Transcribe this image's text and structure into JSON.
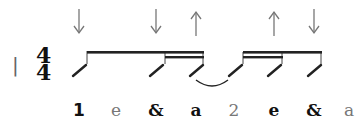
{
  "notation": {
    "barline": "|",
    "time_signature": {
      "top": "4",
      "bottom": "4"
    },
    "strum_arrows": [
      {
        "direction": "down",
        "x": 79
      },
      {
        "direction": "down",
        "x": 156
      },
      {
        "direction": "up",
        "x": 196
      },
      {
        "direction": "up",
        "x": 274
      },
      {
        "direction": "down",
        "x": 314
      }
    ],
    "counting": [
      {
        "label": "1",
        "x": 79,
        "style": "bold"
      },
      {
        "label": "e",
        "x": 116,
        "style": "light"
      },
      {
        "label": "&",
        "x": 156,
        "style": "bold"
      },
      {
        "label": "a",
        "x": 196,
        "style": "bold"
      },
      {
        "label": "2",
        "x": 234,
        "style": "light"
      },
      {
        "label": "e",
        "x": 274,
        "style": "bold"
      },
      {
        "label": "&",
        "x": 314,
        "style": "bold"
      },
      {
        "label": "a",
        "x": 349,
        "style": "light"
      }
    ]
  }
}
